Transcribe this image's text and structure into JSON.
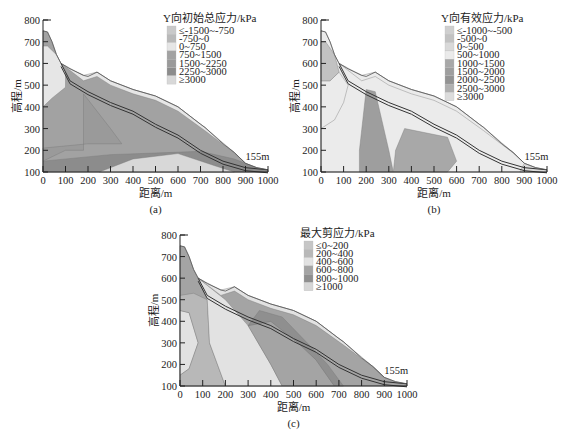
{
  "chart_data": [
    {
      "id": "a",
      "type": "heatmap",
      "title": "Y向初始总应力/kPa",
      "caption": "(a)",
      "xlabel": "距离/m",
      "ylabel": "高程/m",
      "xlim": [
        0,
        1000
      ],
      "ylim": [
        100,
        800
      ],
      "xticks": [
        "0",
        "100",
        "200",
        "300",
        "400",
        "500",
        "600",
        "700",
        "800",
        "900",
        "1000"
      ],
      "yticks": [
        "100",
        "200",
        "300",
        "400",
        "500",
        "600",
        "700",
        "800"
      ],
      "annotation": "155m",
      "legend": [
        "≤-1500~-750",
        "-750~0",
        "0~750",
        "750~1500",
        "1500~2250",
        "2250~3000",
        "≥3000"
      ],
      "legend_colors": [
        "#c9c9c9",
        "#b9b9b9",
        "#e6e6e6",
        "#a2a2a2",
        "#9a9a9a",
        "#8c8c8c",
        "#d8d8d8"
      ],
      "surface_profile": [
        [
          0,
          750
        ],
        [
          20,
          745
        ],
        [
          40,
          700
        ],
        [
          60,
          640
        ],
        [
          80,
          600
        ],
        [
          120,
          575
        ],
        [
          180,
          545
        ],
        [
          200,
          540
        ],
        [
          240,
          560
        ],
        [
          300,
          520
        ],
        [
          400,
          480
        ],
        [
          500,
          450
        ],
        [
          600,
          400
        ],
        [
          700,
          320
        ],
        [
          720,
          305
        ],
        [
          800,
          230
        ],
        [
          850,
          190
        ],
        [
          900,
          140
        ],
        [
          950,
          120
        ],
        [
          1000,
          110
        ]
      ]
    },
    {
      "id": "b",
      "type": "heatmap",
      "title": "Y向有效应力/kPa",
      "caption": "(b)",
      "xlabel": "距离/m",
      "ylabel": "高程/m",
      "xlim": [
        0,
        1000
      ],
      "ylim": [
        100,
        800
      ],
      "xticks": [
        "0",
        "100",
        "200",
        "300",
        "400",
        "500",
        "600",
        "700",
        "800",
        "900",
        "1000"
      ],
      "yticks": [
        "100",
        "200",
        "300",
        "400",
        "500",
        "600",
        "700",
        "800"
      ],
      "annotation": "155m",
      "legend": [
        "≤-1000~-500",
        "-500~0",
        "0~500",
        "500~1000",
        "1000~1500",
        "1500~2000",
        "2000~2500",
        "2500~3000",
        "≥3000"
      ],
      "legend_colors": [
        "#cfcfcf",
        "#c2c2c2",
        "#d9d9d9",
        "#ebebeb",
        "#a8a8a8",
        "#9e9e9e",
        "#939393",
        "#b0b0b0",
        "#dcdcdc"
      ],
      "surface_profile": [
        [
          0,
          750
        ],
        [
          20,
          745
        ],
        [
          40,
          700
        ],
        [
          60,
          640
        ],
        [
          80,
          600
        ],
        [
          120,
          575
        ],
        [
          180,
          545
        ],
        [
          200,
          540
        ],
        [
          240,
          560
        ],
        [
          300,
          520
        ],
        [
          400,
          480
        ],
        [
          500,
          450
        ],
        [
          600,
          400
        ],
        [
          700,
          320
        ],
        [
          720,
          305
        ],
        [
          800,
          230
        ],
        [
          850,
          190
        ],
        [
          900,
          140
        ],
        [
          950,
          120
        ],
        [
          1000,
          110
        ]
      ]
    },
    {
      "id": "c",
      "type": "heatmap",
      "title": "最大剪应力/kPa",
      "caption": "(c)",
      "xlabel": "距离/m",
      "ylabel": "高程/m",
      "xlim": [
        0,
        1000
      ],
      "ylim": [
        100,
        800
      ],
      "xticks": [
        "0",
        "100",
        "200",
        "300",
        "400",
        "500",
        "600",
        "700",
        "800",
        "900",
        "1000"
      ],
      "yticks": [
        "100",
        "200",
        "300",
        "400",
        "500",
        "600",
        "700",
        "800"
      ],
      "annotation": "155m",
      "legend": [
        "≤0~200",
        "200~400",
        "400~600",
        "600~800",
        "800~1000",
        "≥1000"
      ],
      "legend_colors": [
        "#c6c6c6",
        "#b8b8b8",
        "#e2e2e2",
        "#a4a4a4",
        "#8f8f8f",
        "#d6d6d6"
      ],
      "surface_profile": [
        [
          0,
          750
        ],
        [
          20,
          745
        ],
        [
          40,
          700
        ],
        [
          60,
          640
        ],
        [
          80,
          600
        ],
        [
          120,
          575
        ],
        [
          180,
          545
        ],
        [
          200,
          540
        ],
        [
          240,
          560
        ],
        [
          300,
          520
        ],
        [
          400,
          480
        ],
        [
          500,
          450
        ],
        [
          600,
          400
        ],
        [
          700,
          320
        ],
        [
          720,
          305
        ],
        [
          800,
          230
        ],
        [
          850,
          190
        ],
        [
          900,
          140
        ],
        [
          950,
          120
        ],
        [
          1000,
          110
        ]
      ]
    }
  ]
}
